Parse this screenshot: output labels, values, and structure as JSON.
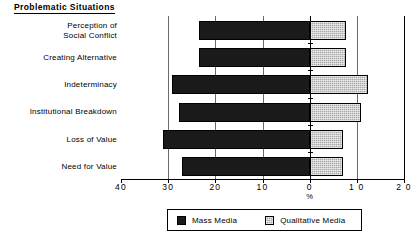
{
  "chart_data": {
    "type": "bar",
    "orientation": "horizontal",
    "subtype": "diverging-bidirectional",
    "title": "Problematic Situations",
    "xlabel": "%",
    "ylabel": "",
    "categories": [
      "Perception of\nSocial Conflict",
      "Creating Alternative",
      "Indeterminacy",
      "Institutional Breakdown",
      "Loss of Value",
      "Need for Value"
    ],
    "category_lines": [
      [
        "Perception of",
        "Social Conflict"
      ],
      [
        "Creating  Alternative"
      ],
      [
        "Indeterminacy"
      ],
      [
        "Institutional  Breakdown"
      ],
      [
        "Loss of Value"
      ],
      [
        "Need for Value"
      ]
    ],
    "series": [
      {
        "name": "Mass Media",
        "direction": "left",
        "color": "#1a1a1a",
        "values": [
          23.5,
          23.4,
          29.2,
          27.6,
          31.1,
          27.0
        ]
      },
      {
        "name": "Qualitative Media",
        "direction": "right",
        "color": "#a8a8a8",
        "values": [
          7.8,
          7.8,
          12.3,
          10.8,
          7.0,
          7.0
        ]
      }
    ],
    "x_ticks": [
      {
        "label": "40",
        "value": -40
      },
      {
        "label": "30",
        "value": -30
      },
      {
        "label": "20",
        "value": -20
      },
      {
        "label": "10",
        "value": -10
      },
      {
        "label": "0",
        "value": 0
      },
      {
        "label": "1 0",
        "value": 10
      },
      {
        "label": "2 0",
        "value": 20
      }
    ],
    "xlim": [
      -40,
      20
    ],
    "grid": true,
    "gridlines_at": [
      -30,
      -20,
      -10,
      0,
      10,
      20
    ],
    "legend_position": "bottom-center"
  },
  "legend": {
    "items": [
      {
        "label": "Mass Media",
        "swatch": "black-square-icon"
      },
      {
        "label": "Qualitative  Media",
        "swatch": "gray-square-icon"
      }
    ]
  },
  "axis": {
    "x_title": "%"
  }
}
